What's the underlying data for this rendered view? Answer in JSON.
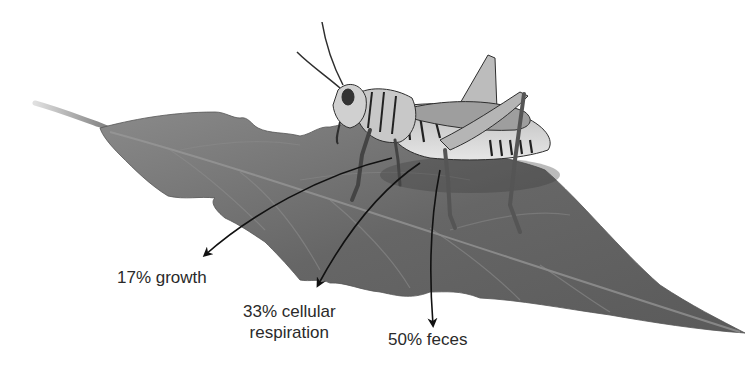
{
  "figure": {
    "leaf_color": "#6e6e6e",
    "arrow_color": "#111111"
  },
  "labels": {
    "growth": {
      "percent": "17%",
      "text": "17% growth"
    },
    "respiration": {
      "percent": "33%",
      "line1": "33% cellular",
      "line2": "respiration"
    },
    "feces": {
      "percent": "50%",
      "text": "50% feces"
    }
  }
}
